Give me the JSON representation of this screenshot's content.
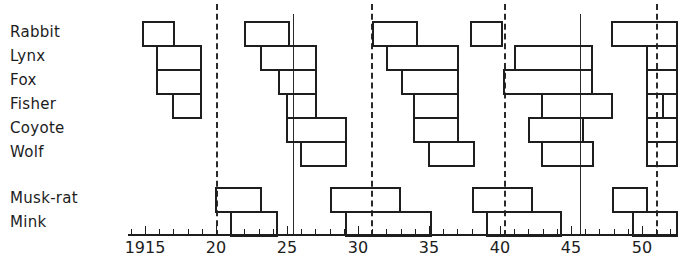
{
  "chart_data": {
    "type": "gantt",
    "title": "",
    "xlabel": "",
    "ylabel": "",
    "xlim": [
      1914,
      1952
    ],
    "x_tick_labels": [
      {
        "year": 1915,
        "label": "1915"
      },
      {
        "year": 1920,
        "label": "20"
      },
      {
        "year": 1925,
        "label": "25"
      },
      {
        "year": 1930,
        "label": "30"
      },
      {
        "year": 1935,
        "label": "35"
      },
      {
        "year": 1940,
        "label": "40"
      },
      {
        "year": 1945,
        "label": "45"
      },
      {
        "year": 1950,
        "label": "50"
      }
    ],
    "reference_lines": [
      {
        "year": 1920.0,
        "style": "dashed"
      },
      {
        "year": 1925.4,
        "style": "solid"
      },
      {
        "year": 1930.9,
        "style": "dashed"
      },
      {
        "year": 1940.3,
        "style": "dashed"
      },
      {
        "year": 1945.6,
        "style": "solid"
      },
      {
        "year": 1951.0,
        "style": "dashed"
      }
    ],
    "series": [
      {
        "name": "Rabbit",
        "periods": [
          [
            1914.8,
            1917.0
          ],
          [
            1922.0,
            1925.1
          ],
          [
            1931.0,
            1934.1
          ],
          [
            1937.9,
            1940.1
          ],
          [
            1947.8,
            1952.5
          ]
        ]
      },
      {
        "name": "Lynx",
        "periods": [
          [
            1915.8,
            1918.9
          ],
          [
            1923.1,
            1927.0
          ],
          [
            1932.0,
            1937.0
          ],
          [
            1941.0,
            1946.4
          ],
          [
            1950.3,
            1952.5
          ]
        ]
      },
      {
        "name": "Fox",
        "periods": [
          [
            1915.8,
            1918.9
          ],
          [
            1924.4,
            1927.0
          ],
          [
            1933.0,
            1937.0
          ],
          [
            1940.2,
            1946.4
          ],
          [
            1950.3,
            1952.5
          ]
        ]
      },
      {
        "name": "Fisher",
        "periods": [
          [
            1916.9,
            1918.9
          ],
          [
            1924.9,
            1927.0
          ],
          [
            1933.9,
            1937.0
          ],
          [
            1942.9,
            1947.8
          ],
          [
            1950.3,
            1951.4
          ],
          [
            1951.4,
            1952.5
          ]
        ]
      },
      {
        "name": "Coyote",
        "periods": [
          [
            1924.9,
            1929.1
          ],
          [
            1933.9,
            1937.0
          ],
          [
            1942.0,
            1945.8
          ],
          [
            1950.3,
            1952.5
          ]
        ]
      },
      {
        "name": "Wolf",
        "periods": [
          [
            1925.9,
            1929.1
          ],
          [
            1934.9,
            1938.1
          ],
          [
            1942.9,
            1946.5
          ],
          [
            1950.3,
            1952.5
          ]
        ]
      },
      {
        "name": "Musk-rat",
        "periods": [
          [
            1919.9,
            1923.1
          ],
          [
            1928.0,
            1932.9
          ],
          [
            1938.0,
            1942.2
          ],
          [
            1947.9,
            1950.3
          ]
        ]
      },
      {
        "name": "Mink",
        "periods": [
          [
            1921.0,
            1924.2
          ],
          [
            1929.1,
            1935.1
          ],
          [
            1939.0,
            1944.2
          ],
          [
            1949.3,
            1952.5
          ]
        ]
      }
    ]
  },
  "rows": [
    {
      "label": "Rabbit",
      "top": 21
    },
    {
      "label": "Lynx",
      "top": 45
    },
    {
      "label": "Fox",
      "top": 69
    },
    {
      "label": "Fisher",
      "top": 93
    },
    {
      "label": "Coyote",
      "top": 117
    },
    {
      "label": "Wolf",
      "top": 141
    },
    {
      "label": "Musk-rat",
      "top": 187
    },
    {
      "label": "Mink",
      "top": 211
    }
  ]
}
